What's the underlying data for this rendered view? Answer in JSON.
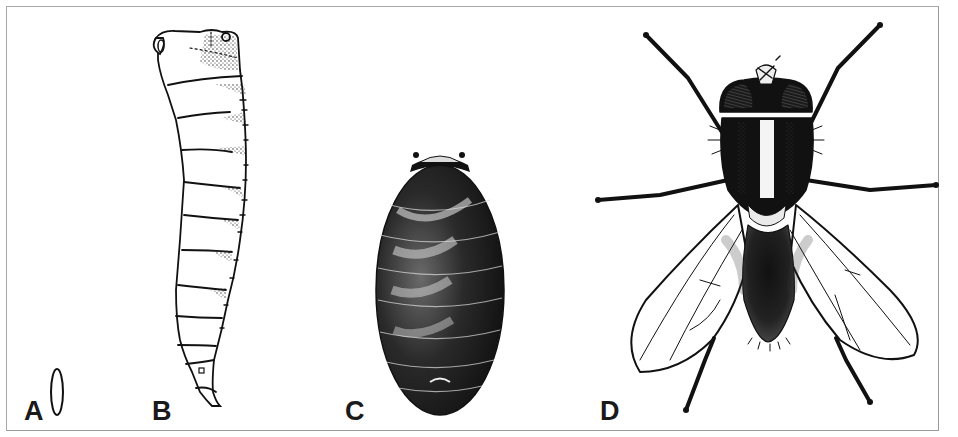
{
  "figure": {
    "panels": [
      {
        "id": "A",
        "label": "A",
        "stage": "egg"
      },
      {
        "id": "B",
        "label": "B",
        "stage": "larva"
      },
      {
        "id": "C",
        "label": "C",
        "stage": "pupa"
      },
      {
        "id": "D",
        "label": "D",
        "stage": "adult"
      }
    ],
    "colors": {
      "ink": "#111111",
      "border": "#a8a8a8",
      "background": "#ffffff"
    }
  }
}
